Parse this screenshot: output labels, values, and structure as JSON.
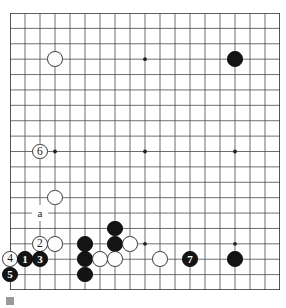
{
  "diagram": {
    "caption": ""
  },
  "board": {
    "size": 19,
    "line_color": "#4a4a4a",
    "border_color": "#2b2b2b",
    "background": "#ffffff",
    "star_points": [
      {
        "col": 3,
        "row": 3
      },
      {
        "col": 9,
        "row": 3
      },
      {
        "col": 15,
        "row": 3
      },
      {
        "col": 3,
        "row": 9
      },
      {
        "col": 9,
        "row": 9
      },
      {
        "col": 15,
        "row": 9
      },
      {
        "col": 3,
        "row": 15
      },
      {
        "col": 9,
        "row": 15
      },
      {
        "col": 15,
        "row": 15
      }
    ]
  },
  "stones": [
    {
      "id": "w-d16",
      "color": "white",
      "col": 3,
      "row": 3,
      "label": ""
    },
    {
      "id": "b-q16",
      "color": "black",
      "col": 15,
      "row": 3,
      "label": ""
    },
    {
      "id": "w-move6",
      "color": "white",
      "col": 2,
      "row": 9,
      "label": "6"
    },
    {
      "id": "w-d7",
      "color": "white",
      "col": 3,
      "row": 12,
      "label": ""
    },
    {
      "id": "w-move2",
      "color": "white",
      "col": 2,
      "row": 15,
      "label": "2"
    },
    {
      "id": "w-d4",
      "color": "white",
      "col": 3,
      "row": 15,
      "label": ""
    },
    {
      "id": "b-f4",
      "color": "black",
      "col": 5,
      "row": 15,
      "label": ""
    },
    {
      "id": "b-h5",
      "color": "black",
      "col": 7,
      "row": 14,
      "label": ""
    },
    {
      "id": "b-h4",
      "color": "black",
      "col": 7,
      "row": 15,
      "label": ""
    },
    {
      "id": "w-j4",
      "color": "white",
      "col": 8,
      "row": 15,
      "label": ""
    },
    {
      "id": "w-move4",
      "color": "white",
      "col": 0,
      "row": 16,
      "label": "4"
    },
    {
      "id": "b-move1",
      "color": "black",
      "col": 1,
      "row": 16,
      "label": "1"
    },
    {
      "id": "b-move3",
      "color": "black",
      "col": 2,
      "row": 16,
      "label": "3"
    },
    {
      "id": "b-f3",
      "color": "black",
      "col": 5,
      "row": 16,
      "label": ""
    },
    {
      "id": "w-g3",
      "color": "white",
      "col": 6,
      "row": 16,
      "label": ""
    },
    {
      "id": "w-h3",
      "color": "white",
      "col": 7,
      "row": 16,
      "label": ""
    },
    {
      "id": "w-l3",
      "color": "white",
      "col": 10,
      "row": 16,
      "label": ""
    },
    {
      "id": "b-move7",
      "color": "black",
      "col": 12,
      "row": 16,
      "label": "7"
    },
    {
      "id": "b-q3",
      "color": "black",
      "col": 15,
      "row": 16,
      "label": ""
    },
    {
      "id": "b-move5",
      "color": "black",
      "col": 0,
      "row": 17,
      "label": "5"
    },
    {
      "id": "b-f2",
      "color": "black",
      "col": 5,
      "row": 17,
      "label": ""
    }
  ],
  "point_labels": [
    {
      "id": "label-a",
      "text": "a",
      "col": 2,
      "row": 13
    }
  ],
  "move_numbers": [
    "1",
    "2",
    "3",
    "4",
    "5",
    "6",
    "7"
  ]
}
